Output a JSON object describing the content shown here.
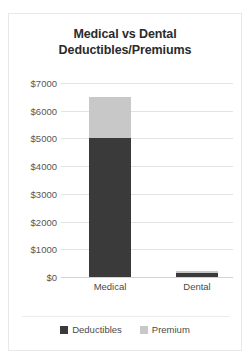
{
  "chart_data": {
    "type": "bar",
    "subtype": "stacked-bar",
    "title": "Medical vs Dental Deductibles/Premiums",
    "title_lines": [
      "Medical vs Dental",
      "Deductibles/Premiums"
    ],
    "categories": [
      "Medical",
      "Dental"
    ],
    "series": [
      {
        "name": "Deductibles",
        "values": [
          5000,
          150
        ],
        "color": "#3a3a3a"
      },
      {
        "name": "Premium",
        "values": [
          1500,
          50
        ],
        "color": "#c8c8c8"
      }
    ],
    "totals": [
      6500,
      200
    ],
    "xlabel": "",
    "ylabel": "",
    "ylim": [
      0,
      7000
    ],
    "ytick_step": 1000,
    "ytick_labels": [
      "$7000",
      "$6000",
      "$5000",
      "$4000",
      "$3000",
      "$2000",
      "$1000",
      "$0"
    ],
    "ytick_values": [
      7000,
      6000,
      5000,
      4000,
      3000,
      2000,
      1000,
      0
    ],
    "grid": true,
    "grid_axis": "y",
    "legend": true,
    "legend_position": "bottom",
    "legend_entries": [
      "Deductibles",
      "Premium"
    ]
  },
  "colors": {
    "deductibles": "#3a3a3a",
    "premium": "#c8c8c8",
    "gridline": "#e3e3e3",
    "card_border": "#e8e8e8",
    "text": "#4a4a4a",
    "title_text": "#2b2b2b"
  }
}
